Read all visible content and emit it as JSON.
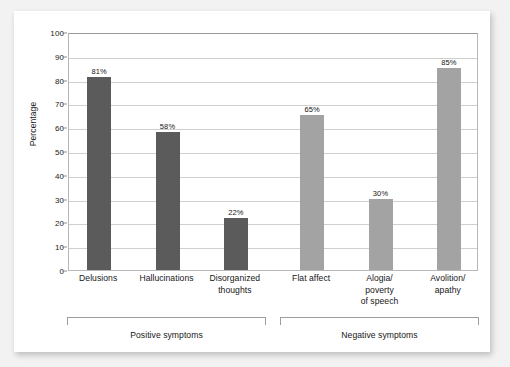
{
  "chart_data": {
    "type": "bar",
    "title": "",
    "xlabel": "",
    "ylabel": "Percentage",
    "ylim": [
      0,
      100
    ],
    "ytick_step": 10,
    "grid": true,
    "legend": "none",
    "yticks": [
      "100",
      "90",
      "80",
      "70",
      "60",
      "50",
      "40",
      "30",
      "20",
      "10",
      "0"
    ],
    "categories": [
      "Delusions",
      "Hallucinations",
      "Disorganized thoughts",
      "Flat affect",
      "Alogia/ poverty of speech",
      "Avolition/ apathy"
    ],
    "category_lines": [
      [
        "Delusions"
      ],
      [
        "Hallucinations"
      ],
      [
        "Disorganized",
        "thoughts"
      ],
      [
        "Flat affect"
      ],
      [
        "Alogia/",
        "poverty",
        "of speech"
      ],
      [
        "Avolition/",
        "apathy"
      ]
    ],
    "values": [
      81,
      58,
      22,
      65,
      30,
      85
    ],
    "value_labels": [
      "81%",
      "58%",
      "22%",
      "65%",
      "30%",
      "85%"
    ],
    "bar_colors": [
      "#5b5b5b",
      "#5b5b5b",
      "#5b5b5b",
      "#a3a3a3",
      "#a3a3a3",
      "#a3a3a3"
    ],
    "groups": [
      {
        "label": "Positive symptoms",
        "category_indices": [
          0,
          1,
          2
        ],
        "color": "#5b5b5b"
      },
      {
        "label": "Negative symptoms",
        "category_indices": [
          3,
          4,
          5
        ],
        "color": "#a3a3a3"
      }
    ]
  },
  "colors": {
    "bar_dark": "#5b5b5b",
    "bar_light": "#a3a3a3",
    "gridline": "#cfcfcf",
    "axis": "#9a9a9a",
    "text": "#171717",
    "panel_background": "#ffffff",
    "page_background": "#f2f2f2"
  }
}
